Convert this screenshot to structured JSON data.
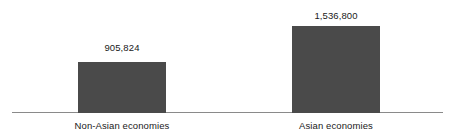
{
  "chart_data": {
    "type": "bar",
    "title": "",
    "subtitle": "",
    "xlabel": "",
    "ylabel": "",
    "categories": [
      "Non-Asian economies",
      "Asian economies"
    ],
    "values": [
      905824,
      1536800
    ],
    "value_labels": [
      "905,824",
      "1,536,800"
    ],
    "ylim": [
      0,
      1700000
    ],
    "grid": false,
    "legend": null,
    "axis": {
      "baseline_visible": true,
      "y_axis_visible": false,
      "tick_labels": []
    },
    "style": {
      "bar_color": "#4a4a4a",
      "axis_color": "#8a8a8a",
      "text_color": "#1a1a1a",
      "background": "#ffffff"
    }
  }
}
